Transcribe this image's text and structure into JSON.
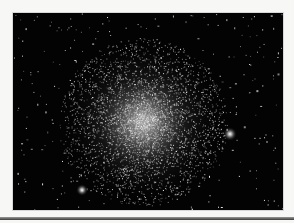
{
  "image": {
    "subject": "globular star cluster",
    "description": "Dense globular star cluster on a black starfield with two bright foreground stars",
    "background_color": "#030303",
    "frame_color": "#f7f7f5",
    "cluster_center": [
      130,
      109
    ],
    "cluster_radius": 80,
    "bright_stars": [
      {
        "x": 217,
        "y": 121,
        "r": 7
      },
      {
        "x": 69,
        "y": 177,
        "r": 6
      }
    ]
  }
}
